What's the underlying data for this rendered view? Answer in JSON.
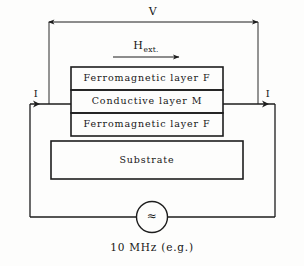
{
  "figure": {
    "type": "device-cross-section-schematic"
  },
  "dimension": {
    "voltage_label": "V",
    "name": "voltage-span"
  },
  "field": {
    "symbol": "H",
    "subscript": "ext.",
    "direction": "right",
    "name": "external-magnetic-field"
  },
  "stack": {
    "layers": [
      {
        "label": "Ferromagnetic  layer  F",
        "id": "top-ferromagnetic-layer"
      },
      {
        "label": "Conductive  layer  M",
        "id": "conductive-layer"
      },
      {
        "label": "Ferromagnetic  layer  F",
        "id": "bottom-ferromagnetic-layer"
      }
    ],
    "substrate": {
      "label": "Substrate",
      "id": "substrate-layer"
    }
  },
  "current": {
    "left_label": "I",
    "right_label": "I"
  },
  "source": {
    "symbol": "≈",
    "caption": "10 MHz (e.g.)",
    "name": "ac-source"
  },
  "colors": {
    "stroke": "#1d1d1d",
    "thin_stroke": "#2a2a2a",
    "background": "#fdfdfc",
    "text": "#161616"
  }
}
